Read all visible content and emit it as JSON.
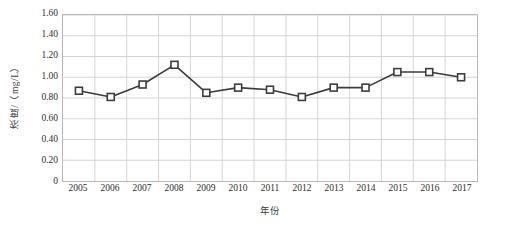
{
  "chart_data": {
    "type": "line",
    "title": "",
    "xlabel": "年份",
    "ylabel": "浓度/（mg/L）",
    "categories": [
      "2005",
      "2006",
      "2007",
      "2008",
      "2009",
      "2010",
      "2011",
      "2012",
      "2013",
      "2014",
      "2015",
      "2016",
      "2017"
    ],
    "values": [
      0.87,
      0.81,
      0.93,
      1.12,
      0.85,
      0.9,
      0.88,
      0.81,
      0.9,
      0.9,
      1.05,
      1.05,
      1.0
    ],
    "series": [
      {
        "name": "浓度",
        "values": [
          0.87,
          0.81,
          0.93,
          1.12,
          0.85,
          0.9,
          0.88,
          0.81,
          0.9,
          0.9,
          1.05,
          1.05,
          1.0
        ]
      }
    ],
    "ylim": [
      0,
      1.6
    ],
    "ytick_labels": [
      "1.60",
      "1.40",
      "1.20",
      "1.00",
      "0.80",
      "0.60",
      "0.40",
      "0.20",
      "0"
    ],
    "ytick_values": [
      1.6,
      1.4,
      1.2,
      1.0,
      0.8,
      0.6,
      0.4,
      0.2,
      0
    ],
    "xtick_labels": [
      "2005",
      "2006",
      "2007",
      "2008",
      "2009",
      "2010",
      "2011",
      "2012",
      "2013",
      "2014",
      "2015",
      "2016",
      "2017"
    ],
    "grid": "both",
    "legend": "none",
    "marker": "square-open",
    "colors": {
      "line": "#3c3c3c",
      "marker_fill": "#ffffff",
      "marker_stroke": "#3c3c3c",
      "grid": "#d4d4d4",
      "axis_border": "#b9b9b9",
      "text": "#2e2e2e",
      "background": "#ffffff"
    }
  }
}
